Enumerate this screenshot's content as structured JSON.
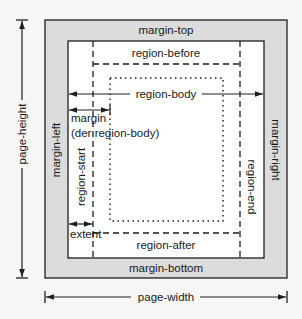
{
  "diagram": {
    "labels": {
      "margin_top": "margin-top",
      "margin_bottom": "margin-bottom",
      "margin_left": "margin-left",
      "margin_right": "margin-right",
      "region_before": "region-before",
      "region_after": "region-after",
      "region_start": "region-start",
      "region_end": "region-end",
      "region_body": "region-body",
      "margin_line1": "margin",
      "margin_line2": "(der region-body)",
      "extent": "extent",
      "page_height": "page-height",
      "page_width": "page-width"
    },
    "colors": {
      "margin_fill": "#dcdcdc",
      "page_inner_fill": "#ffffff",
      "line": "#1e1e1e",
      "background": "#f6f6f4"
    }
  }
}
